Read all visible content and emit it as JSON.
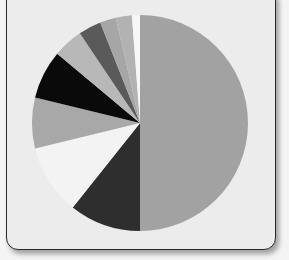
{
  "chart_data": {
    "type": "pie",
    "title": "",
    "center": [
      140,
      123
    ],
    "radius": 108,
    "start_angle_deg": 0,
    "direction": "clockwise",
    "slices": [
      {
        "label": "",
        "value": 50.0,
        "color": "#a2a2a2"
      },
      {
        "label": "",
        "value": 10.7,
        "color": "#2e2e2e"
      },
      {
        "label": "",
        "value": 10.5,
        "color": "#f3f3f3"
      },
      {
        "label": "",
        "value": 7.6,
        "color": "#a8a8a8"
      },
      {
        "label": "",
        "value": 7.3,
        "color": "#0a0a0a"
      },
      {
        "label": "",
        "value": 4.5,
        "color": "#b8b8b8"
      },
      {
        "label": "",
        "value": 3.4,
        "color": "#5a5a5a"
      },
      {
        "label": "",
        "value": 2.4,
        "color": "#a6a6a6"
      },
      {
        "label": "",
        "value": 2.4,
        "color": "#b2b2b2"
      },
      {
        "label": "",
        "value": 1.2,
        "color": "#f7f7f7"
      }
    ],
    "legend": "none"
  },
  "panel": {
    "background": "#ececec",
    "border": "#2a2a2a"
  }
}
